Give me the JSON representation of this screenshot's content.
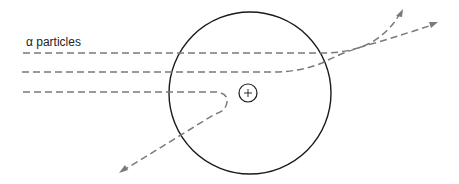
{
  "diagram": {
    "label": "α particles",
    "atom": {
      "shape": "circle",
      "cx": 250,
      "cy": 93,
      "r": 81
    },
    "nucleus": {
      "cx": 248,
      "cy": 93,
      "r": 9,
      "symbol": "+"
    },
    "paths": [
      {
        "id": "path-1",
        "description": "passes far from nucleus, slightly deflected upward",
        "start": [
          23,
          53
        ],
        "end": [
          403,
          10
        ]
      },
      {
        "id": "path-2",
        "description": "passes nearer nucleus, deflected upward",
        "start": [
          22,
          72
        ],
        "end": [
          437,
          23
        ]
      },
      {
        "id": "path-3",
        "description": "head-on approach, back-scattered",
        "start": [
          23,
          92
        ],
        "end": [
          120,
          173
        ]
      }
    ],
    "colors": {
      "atom_outline": "#1a1a1a",
      "particle_path": "#7a7a7a",
      "text": "#222222",
      "background": "#ffffff"
    }
  }
}
